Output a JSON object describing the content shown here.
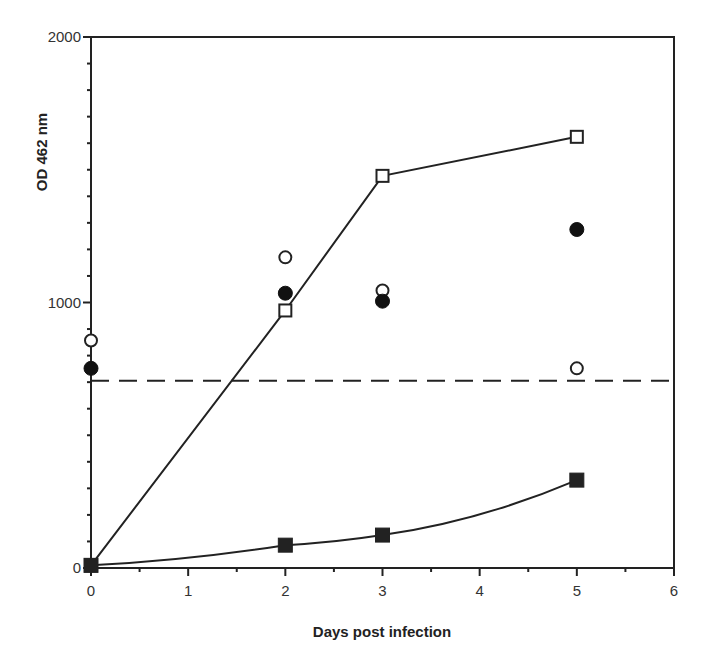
{
  "chart_data": {
    "type": "scatter",
    "title": "",
    "xlabel": "Days post infection",
    "ylabel": "OD 462 nm",
    "xlim": [
      0,
      6
    ],
    "ylim": [
      0,
      2000
    ],
    "x_ticks": [
      0,
      1,
      2,
      3,
      4,
      5,
      6
    ],
    "x_tick_labels": [
      "0",
      "1",
      "2",
      "3",
      "4",
      "5",
      "6"
    ],
    "x_minor_step": 0.5,
    "y_ticks": [
      0,
      1000,
      2000
    ],
    "y_tick_labels": [
      "0",
      "1000",
      "2000"
    ],
    "y_minor_step": 100,
    "grid": false,
    "legend": null,
    "series": [
      {
        "name": "open squares (line)",
        "marker": "square-open",
        "connected": true,
        "x": [
          0,
          2,
          3,
          5
        ],
        "values": [
          10,
          970,
          1477,
          1624
        ]
      },
      {
        "name": "filled squares (line)",
        "marker": "square-filled",
        "connected": true,
        "x": [
          0,
          2,
          3,
          5
        ],
        "values": [
          10,
          86,
          124,
          331
        ]
      },
      {
        "name": "open circles",
        "marker": "circle-open",
        "connected": false,
        "x": [
          0,
          2,
          3,
          5
        ],
        "values": [
          857,
          1170,
          1045,
          752
        ]
      },
      {
        "name": "filled circles",
        "marker": "circle-filled",
        "connected": false,
        "x": [
          0,
          2,
          3,
          5
        ],
        "values": [
          752,
          1035,
          1005,
          1275
        ]
      }
    ],
    "reference_lines": [
      {
        "type": "horizontal-dashed",
        "y": 705,
        "label": ""
      }
    ]
  }
}
